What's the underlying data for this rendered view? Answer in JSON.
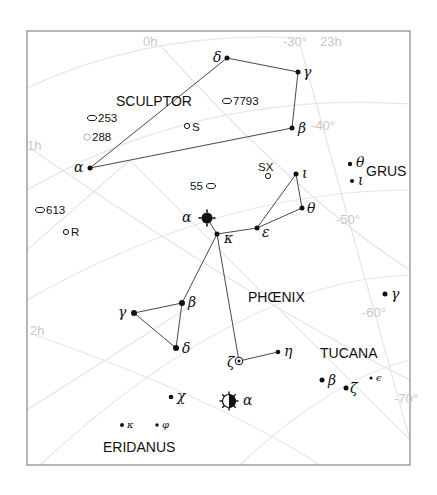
{
  "chart_data": {
    "type": "star-map",
    "title": "",
    "frame": {
      "x": 27,
      "y": 31,
      "width": 383,
      "height": 434
    },
    "coordinate_labels": [
      {
        "id": "ra-0h",
        "text": "0h",
        "x": 143,
        "y": 46
      },
      {
        "id": "dec-30",
        "text": "-30°",
        "x": 283,
        "y": 46
      },
      {
        "id": "ra-23h",
        "text": "23h",
        "x": 320,
        "y": 46
      },
      {
        "id": "ra-1h",
        "text": "1h",
        "x": 27,
        "y": 150
      },
      {
        "id": "dec-40",
        "text": "-40°",
        "x": 311,
        "y": 130
      },
      {
        "id": "dec-50",
        "text": "-50°",
        "x": 336,
        "y": 224
      },
      {
        "id": "ra-2h",
        "text": "2h",
        "x": 30,
        "y": 335
      },
      {
        "id": "dec-60",
        "text": "-60°",
        "x": 362,
        "y": 317
      },
      {
        "id": "dec-70",
        "text": "-70°",
        "x": 394,
        "y": 403
      }
    ],
    "constellations": [
      {
        "id": "sculptor",
        "name": "SCULPTOR",
        "x": 116,
        "y": 106
      },
      {
        "id": "grus",
        "name": "GRUS",
        "x": 366,
        "y": 176
      },
      {
        "id": "phoenix",
        "name": "PHŒNIX",
        "x": 248,
        "y": 302
      },
      {
        "id": "tucana",
        "name": "TUCANA",
        "x": 320,
        "y": 358
      },
      {
        "id": "eridanus",
        "name": "ERIDANUS",
        "x": 103,
        "y": 452
      }
    ],
    "stars": [
      {
        "id": "scl-alpha",
        "label": "α",
        "x": 90,
        "y": 168,
        "r": 2.5,
        "lx": 74,
        "ly": 172
      },
      {
        "id": "scl-delta",
        "label": "δ",
        "x": 227,
        "y": 58,
        "r": 2.5,
        "lx": 213,
        "ly": 62
      },
      {
        "id": "scl-gamma",
        "label": "γ",
        "x": 298,
        "y": 72,
        "r": 2.5,
        "lx": 303,
        "ly": 77
      },
      {
        "id": "scl-beta",
        "label": "β",
        "x": 292,
        "y": 128,
        "r": 2.5,
        "lx": 298,
        "ly": 133
      },
      {
        "id": "gru-theta",
        "label": "θ",
        "x": 350,
        "y": 164,
        "r": 2.2,
        "lx": 356,
        "ly": 167
      },
      {
        "id": "gru-iota",
        "label": "ι",
        "x": 352,
        "y": 181,
        "r": 2.0,
        "lx": 358,
        "ly": 185
      },
      {
        "id": "phe-alpha",
        "label": "α",
        "x": 207,
        "y": 218,
        "r": 5.5,
        "lx": 182,
        "ly": 222,
        "symbol": "variable-bright"
      },
      {
        "id": "phe-kappa",
        "label": "κ",
        "x": 217,
        "y": 234,
        "r": 2.5,
        "lx": 224,
        "ly": 243
      },
      {
        "id": "phe-epsilon",
        "label": "ε",
        "x": 257,
        "y": 228,
        "r": 2.5,
        "lx": 262,
        "ly": 237
      },
      {
        "id": "phe-iota",
        "label": "ι",
        "x": 296,
        "y": 174,
        "r": 2.5,
        "lx": 302,
        "ly": 178
      },
      {
        "id": "phe-theta",
        "label": "θ",
        "x": 302,
        "y": 208,
        "r": 2.5,
        "lx": 307,
        "ly": 213
      },
      {
        "id": "phe-beta",
        "label": "β",
        "x": 182,
        "y": 303,
        "r": 3.0,
        "lx": 188,
        "ly": 307
      },
      {
        "id": "phe-gamma",
        "label": "γ",
        "x": 134,
        "y": 313,
        "r": 3.0,
        "lx": 118,
        "ly": 317
      },
      {
        "id": "phe-delta",
        "label": "δ",
        "x": 176,
        "y": 348,
        "r": 3.0,
        "lx": 182,
        "ly": 353
      },
      {
        "id": "phe-zeta",
        "label": "ζ",
        "x": 239,
        "y": 361,
        "r": 3.0,
        "lx": 227,
        "ly": 367,
        "symbol": "double"
      },
      {
        "id": "phe-eta",
        "label": "η",
        "x": 278,
        "y": 352,
        "r": 2.3,
        "lx": 284,
        "ly": 356
      },
      {
        "id": "phe-chi",
        "label": "χ",
        "x": 171,
        "y": 397,
        "r": 2.3,
        "lx": 177,
        "ly": 401
      },
      {
        "id": "eri-kappa",
        "label": "κ",
        "x": 122,
        "y": 425,
        "r": 2.0,
        "lx": 127,
        "ly": 428,
        "small": true
      },
      {
        "id": "eri-phi",
        "label": "φ",
        "x": 157,
        "y": 425,
        "r": 1.7,
        "lx": 162,
        "ly": 428,
        "small": true
      },
      {
        "id": "eri-alpha",
        "label": "α",
        "x": 229,
        "y": 401,
        "r": 6.5,
        "lx": 243,
        "ly": 405,
        "symbol": "variable-half"
      },
      {
        "id": "tuc-gamma",
        "label": "γ",
        "x": 385,
        "y": 294,
        "r": 2.5,
        "lx": 391,
        "ly": 299
      },
      {
        "id": "tuc-beta",
        "label": "β",
        "x": 322,
        "y": 380,
        "r": 2.5,
        "lx": 328,
        "ly": 385
      },
      {
        "id": "tuc-zeta",
        "label": "ζ",
        "x": 346,
        "y": 388,
        "r": 2.5,
        "lx": 350,
        "ly": 393
      },
      {
        "id": "tuc-epsilon",
        "label": "ϵ",
        "x": 371,
        "y": 378,
        "r": 1.6,
        "lx": 376,
        "ly": 381,
        "small": true
      }
    ],
    "lines": [
      [
        "scl-alpha",
        "scl-beta"
      ],
      [
        "scl-beta",
        "scl-gamma"
      ],
      [
        "scl-gamma",
        "scl-delta"
      ],
      [
        "scl-delta",
        "scl-alpha"
      ],
      [
        "phe-alpha",
        "phe-kappa"
      ],
      [
        "phe-kappa",
        "phe-epsilon"
      ],
      [
        "phe-epsilon",
        "phe-iota"
      ],
      [
        "phe-iota",
        "phe-theta"
      ],
      [
        "phe-theta",
        "phe-epsilon"
      ],
      [
        "phe-kappa",
        "phe-beta"
      ],
      [
        "phe-beta",
        "phe-gamma"
      ],
      [
        "phe-gamma",
        "phe-delta"
      ],
      [
        "phe-delta",
        "phe-beta"
      ],
      [
        "phe-kappa",
        "phe-zeta"
      ],
      [
        "phe-zeta",
        "phe-eta"
      ]
    ],
    "deep_sky_objects": [
      {
        "id": "ngc-253",
        "label": "253",
        "type": "galaxy",
        "x": 92,
        "y": 118,
        "lx": 98,
        "ly": 122
      },
      {
        "id": "ngc-288",
        "label": "288",
        "type": "globular-cluster",
        "x": 87,
        "y": 137,
        "lx": 92,
        "ly": 141
      },
      {
        "id": "scl-s",
        "label": "S",
        "type": "variable-star",
        "x": 187,
        "y": 126,
        "lx": 192,
        "ly": 131
      },
      {
        "id": "ngc-7793",
        "label": "7793",
        "type": "galaxy",
        "x": 227,
        "y": 101,
        "lx": 233,
        "ly": 105
      },
      {
        "id": "ngc-55",
        "label": "55",
        "type": "galaxy",
        "x": 211,
        "y": 186,
        "lx": 190,
        "ly": 190
      },
      {
        "id": "ngc-613",
        "label": "613",
        "type": "galaxy",
        "x": 40,
        "y": 210,
        "lx": 46,
        "ly": 214
      },
      {
        "id": "scl-r",
        "label": "R",
        "type": "variable-star",
        "x": 66,
        "y": 232,
        "lx": 71,
        "ly": 236
      },
      {
        "id": "phe-sx",
        "label": "SX",
        "type": "variable-star",
        "x": 268,
        "y": 176,
        "lx": 258,
        "ly": 171
      }
    ]
  }
}
